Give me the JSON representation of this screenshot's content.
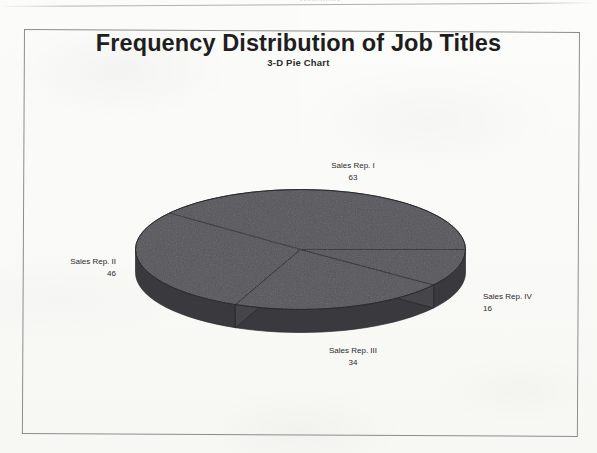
{
  "page": {
    "top_partial_text": "(…………)",
    "background_color": "#fbfbf9",
    "frame_color": "#8d8d8d"
  },
  "chart_data": {
    "type": "pie",
    "title": "Frequency Distribution of Job Titles",
    "subtitle": "3-D Pie Chart",
    "xlabel": "",
    "ylabel": "",
    "three_d": true,
    "legend": "none",
    "grid": false,
    "labels_show_value": true,
    "total": 159,
    "categories": [
      "Sales Rep. I",
      "Sales Rep. II",
      "Sales Rep. III",
      "Sales Rep. IV"
    ],
    "values": [
      63,
      46,
      34,
      16
    ],
    "slices": [
      {
        "label": "Sales Rep. I",
        "value": 63,
        "percent": 39.6,
        "start_angle": 0,
        "end_angle": 142.6,
        "color": "#55555a",
        "side_color": "#3a3a3e"
      },
      {
        "label": "Sales Rep. II",
        "value": 46,
        "percent": 28.9,
        "start_angle": 142.6,
        "end_angle": 246.8,
        "color": "#55555a",
        "side_color": "#3a3a3e"
      },
      {
        "label": "Sales Rep. III",
        "value": 34,
        "percent": 21.4,
        "start_angle": 246.8,
        "end_angle": 323.8,
        "color": "#55555a",
        "side_color": "#3a3a3e"
      },
      {
        "label": "Sales Rep. IV",
        "value": 16,
        "percent": 10.1,
        "start_angle": 323.8,
        "end_angle": 360,
        "color": "#55555a",
        "side_color": "#3a3a3e"
      }
    ]
  },
  "labels": {
    "s1_name": "Sales Rep. I",
    "s1_value": "63",
    "s2_name": "Sales Rep. II",
    "s2_value": "46",
    "s3_name": "Sales Rep. III",
    "s3_value": "34",
    "s4_name": "Sales Rep. IV",
    "s4_value": "16"
  }
}
